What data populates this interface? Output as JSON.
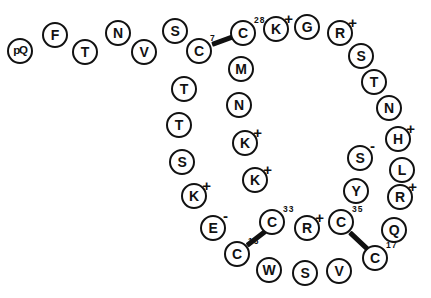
{
  "diagram": {
    "residue_shape": "circle",
    "ink_color": "#111111",
    "background_color": "#ffffff"
  },
  "residues": [
    {
      "label": "pQ",
      "charge": "",
      "number": "",
      "x": 20,
      "y": 51,
      "narrow": true
    },
    {
      "label": "F",
      "charge": "",
      "number": "",
      "x": 55,
      "y": 35,
      "narrow": false
    },
    {
      "label": "T",
      "charge": "",
      "number": "",
      "x": 85,
      "y": 52,
      "narrow": false
    },
    {
      "label": "N",
      "charge": "",
      "number": "",
      "x": 118,
      "y": 33,
      "narrow": false
    },
    {
      "label": "V",
      "charge": "",
      "number": "",
      "x": 144,
      "y": 52,
      "narrow": false
    },
    {
      "label": "S",
      "charge": "",
      "number": "",
      "x": 175,
      "y": 31,
      "narrow": false
    },
    {
      "label": "C",
      "charge": "",
      "number": "7",
      "x": 199,
      "y": 51,
      "narrow": false
    },
    {
      "label": "C",
      "charge": "",
      "number": "28",
      "x": 243,
      "y": 33,
      "narrow": false
    },
    {
      "label": "K",
      "charge": "+",
      "number": "",
      "x": 276,
      "y": 29,
      "narrow": false
    },
    {
      "label": "G",
      "charge": "",
      "number": "",
      "x": 307,
      "y": 27,
      "narrow": false
    },
    {
      "label": "R",
      "charge": "+",
      "number": "",
      "x": 340,
      "y": 33,
      "narrow": false
    },
    {
      "label": "S",
      "charge": "",
      "number": "",
      "x": 361,
      "y": 56,
      "narrow": false
    },
    {
      "label": "T",
      "charge": "",
      "number": "",
      "x": 374,
      "y": 82,
      "narrow": false
    },
    {
      "label": "N",
      "charge": "",
      "number": "",
      "x": 389,
      "y": 108,
      "narrow": false
    },
    {
      "label": "H",
      "charge": "+",
      "number": "",
      "x": 398,
      "y": 139,
      "narrow": false
    },
    {
      "label": "L",
      "charge": "",
      "number": "",
      "x": 402,
      "y": 170,
      "narrow": false
    },
    {
      "label": "R",
      "charge": "+",
      "number": "",
      "x": 400,
      "y": 197,
      "narrow": false
    },
    {
      "label": "Q",
      "charge": "",
      "number": "",
      "x": 394,
      "y": 230,
      "narrow": false
    },
    {
      "label": "C",
      "charge": "",
      "number": "17",
      "x": 375,
      "y": 258,
      "narrow": false
    },
    {
      "label": "V",
      "charge": "",
      "number": "",
      "x": 339,
      "y": 271,
      "narrow": false
    },
    {
      "label": "S",
      "charge": "",
      "number": "",
      "x": 305,
      "y": 273,
      "narrow": false
    },
    {
      "label": "W",
      "charge": "",
      "number": "",
      "x": 269,
      "y": 270,
      "narrow": false
    },
    {
      "label": "C",
      "charge": "",
      "number": "13",
      "x": 237,
      "y": 254,
      "narrow": false
    },
    {
      "label": "E",
      "charge": "-",
      "number": "",
      "x": 213,
      "y": 228,
      "narrow": false
    },
    {
      "label": "K",
      "charge": "+",
      "number": "",
      "x": 194,
      "y": 196,
      "narrow": false
    },
    {
      "label": "S",
      "charge": "",
      "number": "",
      "x": 182,
      "y": 162,
      "narrow": false
    },
    {
      "label": "T",
      "charge": "",
      "number": "",
      "x": 179,
      "y": 125,
      "narrow": false
    },
    {
      "label": "T",
      "charge": "",
      "number": "",
      "x": 184,
      "y": 89,
      "narrow": false
    },
    {
      "label": "M",
      "charge": "",
      "number": "",
      "x": 241,
      "y": 69,
      "narrow": false
    },
    {
      "label": "N",
      "charge": "",
      "number": "",
      "x": 239,
      "y": 105,
      "narrow": false
    },
    {
      "label": "K",
      "charge": "+",
      "number": "",
      "x": 245,
      "y": 143,
      "narrow": false
    },
    {
      "label": "K",
      "charge": "+",
      "number": "",
      "x": 255,
      "y": 180,
      "narrow": false
    },
    {
      "label": "C",
      "charge": "",
      "number": "33",
      "x": 272,
      "y": 222,
      "narrow": false
    },
    {
      "label": "R",
      "charge": "+",
      "number": "",
      "x": 307,
      "y": 228,
      "narrow": false
    },
    {
      "label": "C",
      "charge": "",
      "number": "35",
      "x": 341,
      "y": 222,
      "narrow": false
    },
    {
      "label": "Y",
      "charge": "",
      "number": "",
      "x": 356,
      "y": 191,
      "narrow": false
    },
    {
      "label": "S",
      "charge": "-",
      "number": "",
      "x": 360,
      "y": 158,
      "narrow": false
    }
  ],
  "disulfide_bonds": [
    {
      "name": "bond-c7-c28",
      "x1": 212,
      "y1": 44,
      "x2": 234,
      "y2": 36
    },
    {
      "name": "bond-c13-c33",
      "x1": 247,
      "y1": 245,
      "x2": 265,
      "y2": 231
    },
    {
      "name": "bond-c35-c17",
      "x1": 350,
      "y1": 232,
      "x2": 368,
      "y2": 249
    }
  ]
}
